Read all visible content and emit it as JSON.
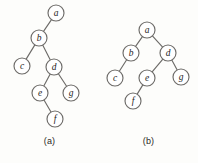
{
  "figure": {
    "width": 198,
    "height": 163,
    "background_color": "#fdfdfb",
    "stroke_color": "#6d6b68",
    "node_fill_color": "#ffffff",
    "label_color": "#1f1d1b"
  },
  "chart_data": {
    "type": "diagram",
    "title": "",
    "subtitle": "",
    "diagram_kind": "binary-tree-pair",
    "panels": [
      {
        "id": "a",
        "caption": "(a)",
        "root": "a",
        "node_radius": 8,
        "nodes": [
          {
            "id": "a",
            "label": "a",
            "cx": 56,
            "cy": 13
          },
          {
            "id": "b",
            "label": "b",
            "cx": 39,
            "cy": 38
          },
          {
            "id": "c",
            "label": "c",
            "cx": 22,
            "cy": 66
          },
          {
            "id": "d",
            "label": "d",
            "cx": 54,
            "cy": 67
          },
          {
            "id": "e",
            "label": "e",
            "cx": 40,
            "cy": 93
          },
          {
            "id": "g",
            "label": "g",
            "cx": 71,
            "cy": 93
          },
          {
            "id": "f",
            "label": "f",
            "cx": 55,
            "cy": 119
          }
        ],
        "edges": [
          {
            "from": "a",
            "to": "b",
            "side": "left"
          },
          {
            "from": "b",
            "to": "c",
            "side": "left"
          },
          {
            "from": "b",
            "to": "d",
            "side": "right"
          },
          {
            "from": "d",
            "to": "e",
            "side": "left"
          },
          {
            "from": "d",
            "to": "g",
            "side": "right"
          },
          {
            "from": "e",
            "to": "f",
            "side": "right"
          }
        ]
      },
      {
        "id": "b",
        "caption": "(b)",
        "root": "a",
        "node_radius": 8,
        "nodes": [
          {
            "id": "a",
            "label": "a",
            "cx": 48,
            "cy": 30
          },
          {
            "id": "b",
            "label": "b",
            "cx": 32,
            "cy": 53
          },
          {
            "id": "d",
            "label": "d",
            "cx": 69,
            "cy": 53
          },
          {
            "id": "c",
            "label": "c",
            "cx": 16,
            "cy": 78
          },
          {
            "id": "e",
            "label": "e",
            "cx": 48,
            "cy": 78
          },
          {
            "id": "g",
            "label": "g",
            "cx": 82,
            "cy": 77
          },
          {
            "id": "f",
            "label": "f",
            "cx": 34,
            "cy": 101
          }
        ],
        "edges": [
          {
            "from": "a",
            "to": "b",
            "side": "left"
          },
          {
            "from": "a",
            "to": "d",
            "side": "right"
          },
          {
            "from": "b",
            "to": "c",
            "side": "left"
          },
          {
            "from": "d",
            "to": "e",
            "side": "left"
          },
          {
            "from": "d",
            "to": "g",
            "side": "right"
          },
          {
            "from": "e",
            "to": "f",
            "side": "left"
          }
        ]
      }
    ]
  }
}
